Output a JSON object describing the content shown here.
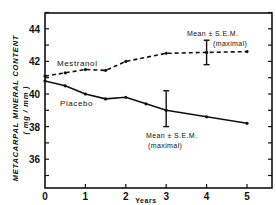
{
  "chart_data": {
    "type": "line",
    "title": "",
    "xlabel": "Years",
    "ylabel": "METACARPAL MINERAL CONTENT",
    "ylabel_units": "( mg / mm )",
    "xlim": [
      0,
      5.6
    ],
    "ylim": [
      35,
      45
    ],
    "x_ticks": [
      0,
      1,
      2,
      3,
      4,
      5
    ],
    "x_tick_labels": [
      "0",
      "1",
      "2",
      "3",
      "4",
      "5"
    ],
    "y_ticks": [
      36,
      38,
      40,
      42,
      44
    ],
    "y_tick_labels": [
      "36",
      "38",
      "40",
      "42",
      "44"
    ],
    "grid": false,
    "legend_position": "inline labels",
    "series": [
      {
        "name": "Mestranol",
        "style": "dashed",
        "x": [
          0,
          0.5,
          1,
          1.5,
          2,
          3,
          4,
          5
        ],
        "values": [
          41.1,
          41.3,
          41.5,
          41.45,
          42.0,
          42.5,
          42.55,
          42.6
        ],
        "error_bar": {
          "x": 4,
          "mean": 42.55,
          "low": 41.8,
          "high": 43.3,
          "label": "Mean ± S.E.M.",
          "sublabel": "(maximal)"
        }
      },
      {
        "name": "Placebo",
        "style": "solid",
        "x": [
          0,
          0.5,
          1,
          1.5,
          2,
          2.5,
          3,
          4,
          5
        ],
        "values": [
          40.8,
          40.5,
          40.0,
          39.7,
          39.8,
          39.4,
          39.0,
          38.6,
          38.2
        ],
        "error_bar": {
          "x": 3,
          "mean": 39.0,
          "low": 38.0,
          "high": 40.2,
          "label": "Mean ± S.E.M.",
          "sublabel": "(maximal)"
        }
      }
    ],
    "annotations": [
      {
        "text": "Mestranol",
        "near_series": "Mestranol"
      },
      {
        "text": "Placebo",
        "near_series": "Placebo"
      },
      {
        "text": "Mean ± S.E.M.",
        "subtext": "(maximal)",
        "near": "Mestranol error bar at year 4"
      },
      {
        "text": "Mean ± S.E.M.",
        "subtext": "(maximal)",
        "near": "Placebo error bar at year 3"
      }
    ]
  },
  "labels": {
    "ylabel": "METACARPAL MINERAL CONTENT",
    "ylabel_units": "( mg / mm )",
    "xlabel": "Years",
    "mestranol": "Mestranol",
    "placebo": "Placebo",
    "sem_upper_line1": "Mean ± S.E.M.",
    "sem_upper_line2": "(maximal)",
    "sem_lower_line1": "Mean ± S.E.M.",
    "sem_lower_line2": "(maximal)"
  }
}
